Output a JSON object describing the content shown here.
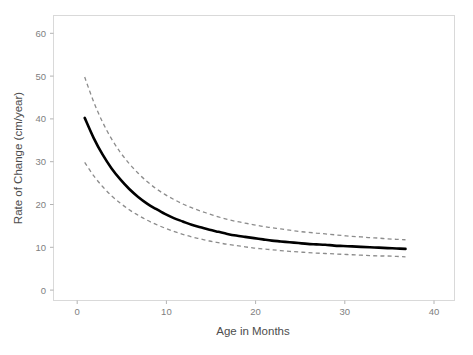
{
  "chart_data": {
    "type": "line",
    "title": "",
    "xlabel": "Age in Months",
    "ylabel": "Rate of Change (cm/year)",
    "xlim": [
      -2.5,
      42.5
    ],
    "ylim": [
      -3.5,
      65
    ],
    "xticks": [
      0,
      10,
      20,
      30,
      40
    ],
    "xticklabels": [
      "0",
      "10",
      "20",
      "30",
      "40"
    ],
    "yticks": [
      0,
      10,
      20,
      30,
      40,
      50,
      60
    ],
    "yticklabels": [
      "0",
      "10",
      "20",
      "30",
      "40",
      "50",
      "60"
    ],
    "grid": false,
    "legend": null,
    "x": [
      1,
      2,
      3,
      4,
      5,
      6,
      7,
      8,
      9,
      10,
      11,
      12,
      13,
      14,
      15,
      16,
      17,
      18,
      19,
      20,
      21,
      22,
      23,
      24,
      25,
      26,
      27,
      28,
      29,
      30,
      31,
      32,
      33,
      34,
      35,
      36,
      37
    ],
    "series": [
      {
        "name": "fit",
        "style": "solid",
        "color": "#000000",
        "values": [
          40.4,
          35.6,
          31.6,
          28.3,
          25.6,
          23.3,
          21.4,
          19.8,
          18.5,
          17.3,
          16.3,
          15.5,
          14.7,
          14.1,
          13.5,
          13.0,
          12.5,
          12.1,
          11.8,
          11.5,
          11.2,
          10.9,
          10.7,
          10.5,
          10.3,
          10.1,
          10.0,
          9.9,
          9.7,
          9.6,
          9.5,
          9.4,
          9.3,
          9.2,
          9.1,
          9.0,
          8.9
        ]
      },
      {
        "name": "upper-confidence-band",
        "style": "dashed",
        "color": "#8c8c8c",
        "values": [
          50.2,
          44.3,
          39.4,
          35.4,
          32.1,
          29.4,
          27.1,
          25.1,
          23.4,
          22.0,
          20.8,
          19.7,
          18.8,
          18.0,
          17.3,
          16.6,
          16.0,
          15.5,
          15.1,
          14.7,
          14.3,
          14.0,
          13.7,
          13.4,
          13.1,
          12.9,
          12.7,
          12.5,
          12.3,
          12.1,
          11.9,
          11.8,
          11.6,
          11.5,
          11.3,
          11.2,
          11.1
        ]
      },
      {
        "name": "lower-confidence-band",
        "style": "dashed",
        "color": "#8c8c8c",
        "values": [
          29.7,
          26.5,
          23.9,
          21.7,
          19.9,
          18.3,
          17.0,
          15.8,
          14.8,
          13.9,
          13.1,
          12.4,
          11.8,
          11.3,
          10.8,
          10.4,
          10.0,
          9.7,
          9.4,
          9.1,
          8.9,
          8.7,
          8.5,
          8.3,
          8.2,
          8.0,
          7.9,
          7.8,
          7.7,
          7.6,
          7.5,
          7.4,
          7.3,
          7.2,
          7.2,
          7.1,
          7.0
        ]
      }
    ]
  },
  "axes": {
    "x_title": "Age in Months",
    "y_title": "Rate of Change (cm/year)"
  },
  "colors": {
    "fit": "#000000",
    "band": "#8c8c8c",
    "panel_border": "#d9d9d9",
    "tick_text": "#808080",
    "axis_title": "#4d4d4d",
    "background": "#ffffff"
  }
}
